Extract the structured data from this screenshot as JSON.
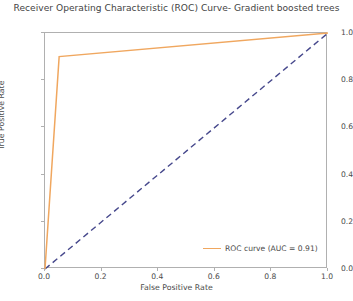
{
  "chart_data": {
    "type": "line",
    "title": "Receiver Operating Characteristic (ROC) Curve- Gradient boosted trees",
    "xlabel": "False Positive Rate",
    "ylabel": "True Positive Rate",
    "xlim": [
      0.0,
      1.0
    ],
    "ylim": [
      0.0,
      1.0
    ],
    "xticks": [
      "0.0",
      "0.2",
      "0.4",
      "0.6",
      "0.8",
      "1.0"
    ],
    "yticks": [
      "0.0",
      "0.2",
      "0.4",
      "0.6",
      "0.8",
      "1.0"
    ],
    "xtick_values": [
      0.0,
      0.2,
      0.4,
      0.6,
      0.8,
      1.0
    ],
    "ytick_values": [
      0.0,
      0.2,
      0.4,
      0.6,
      0.8,
      1.0
    ],
    "grid": false,
    "legend_position": "lower right",
    "series": [
      {
        "name": "ROC curve (AUC = 0.91)",
        "color": "#f0a75f",
        "linestyle": "solid",
        "x": [
          0.0,
          0.05,
          1.0
        ],
        "y": [
          0.0,
          0.9,
          1.0
        ]
      },
      {
        "name": "chance-diagonal",
        "color": "#46488c",
        "linestyle": "dashed",
        "x": [
          0.0,
          1.0
        ],
        "y": [
          0.0,
          1.0
        ]
      }
    ],
    "annotations": {
      "auc": "0.91"
    }
  },
  "legend": {
    "roc_label": "ROC curve (AUC = 0.91)"
  },
  "colors": {
    "roc_curve": "#f0a75f",
    "chance_line": "#46488c",
    "spine": "#b0b0b0",
    "text": "#4a4a4a",
    "background": "#ffffff"
  }
}
